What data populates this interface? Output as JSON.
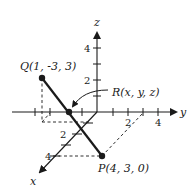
{
  "diagram": {
    "type": "3d-coordinate-axes",
    "axes": {
      "x": {
        "label": "x",
        "ticks": [
          "2",
          "4"
        ]
      },
      "y": {
        "label": "y",
        "ticks": [
          "2",
          "4"
        ]
      },
      "z": {
        "label": "z",
        "ticks": [
          "2",
          "4"
        ]
      }
    },
    "points": {
      "Q": {
        "name": "Q",
        "coords": "(1, -3, 3)",
        "label": "Q(1, -3, 3)"
      },
      "P": {
        "name": "P",
        "coords": "(4, 3, 0)",
        "label": "P(4, 3, 0)"
      },
      "R": {
        "name": "R",
        "coords": "(x, y, z)",
        "label": "R(x, y, z)"
      }
    },
    "segment": {
      "from": "Q",
      "to": "P",
      "through": "R"
    },
    "colors": {
      "ink": "#1a1a1a",
      "background": "#ffffff"
    }
  }
}
